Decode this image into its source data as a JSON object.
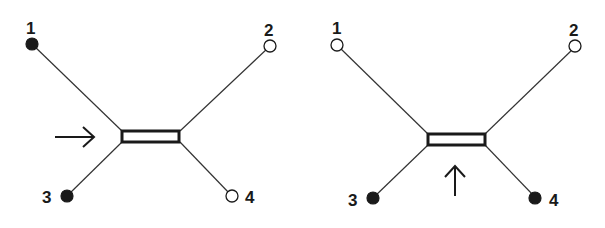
{
  "diagrams": [
    {
      "id": "left",
      "nodes": [
        {
          "label": "1",
          "state": "filled"
        },
        {
          "label": "2",
          "state": "open"
        },
        {
          "label": "3",
          "state": "filled"
        },
        {
          "label": "4",
          "state": "open"
        }
      ],
      "arrow": {
        "direction": "right"
      }
    },
    {
      "id": "right",
      "nodes": [
        {
          "label": "1",
          "state": "open"
        },
        {
          "label": "2",
          "state": "open"
        },
        {
          "label": "3",
          "state": "filled"
        },
        {
          "label": "4",
          "state": "filled"
        }
      ],
      "arrow": {
        "direction": "up"
      }
    }
  ],
  "colors": {
    "ink": "#1a1a1a",
    "background": "#ffffff"
  }
}
